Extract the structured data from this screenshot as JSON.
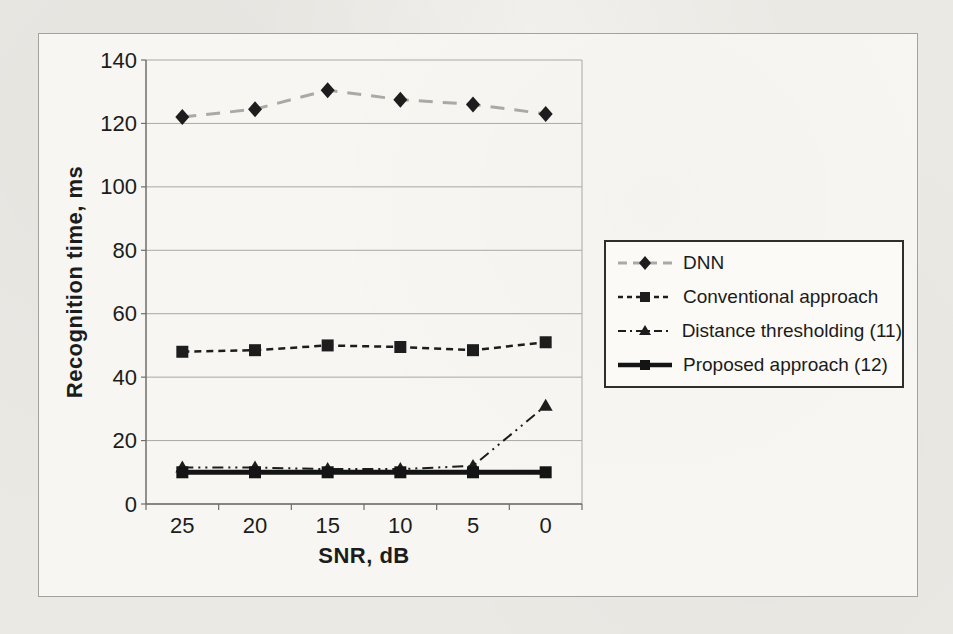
{
  "figure": {
    "page_background": "#eae9e4",
    "panel_background": "#f7f6f2",
    "panel_border_color": "#a3a39e",
    "axis_color": "#6f6f6a",
    "gridline_color": "#a9a9a4",
    "text_color": "#1c1c1c",
    "legend_border_color": "#2e2e2c",
    "legend_background": "#fbfaf7"
  },
  "chart_data": {
    "type": "line",
    "title": "",
    "xlabel": "SNR, dB",
    "ylabel": "Recognition time, ms",
    "categories": [
      "25",
      "20",
      "15",
      "10",
      "5",
      "0"
    ],
    "ylim": [
      0,
      140
    ],
    "ytick_step": 20,
    "grid": true,
    "legend_position": "right",
    "series": [
      {
        "name": "DNN",
        "values": [
          122,
          124.5,
          130.5,
          127.5,
          126,
          123
        ],
        "color": "#a9a9a5",
        "line_style": "dashed",
        "line_width": 3,
        "marker": "diamond",
        "marker_color": "#1d1d1d"
      },
      {
        "name": "Conventional approach",
        "values": [
          48,
          48.5,
          50,
          49.5,
          48.5,
          51
        ],
        "color": "#1d1d1d",
        "line_style": "short-dash",
        "line_width": 2.5,
        "marker": "square",
        "marker_color": "#1d1d1d"
      },
      {
        "name": "Distance thresholding (11)",
        "values": [
          11.5,
          11.5,
          11,
          11,
          12,
          31
        ],
        "color": "#1d1d1d",
        "line_style": "dash-dot-dot",
        "line_width": 2,
        "marker": "triangle",
        "marker_color": "#1d1d1d"
      },
      {
        "name": "Proposed approach (12)",
        "values": [
          10,
          10,
          10,
          10,
          10,
          10
        ],
        "color": "#141414",
        "line_style": "solid",
        "line_width": 5,
        "marker": "square",
        "marker_color": "#141414"
      }
    ]
  }
}
